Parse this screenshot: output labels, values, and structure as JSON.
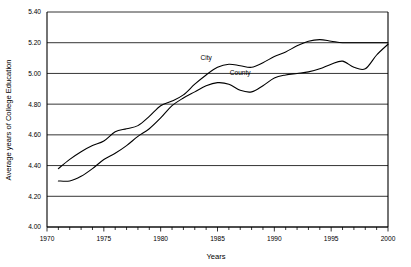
{
  "chart_data": {
    "type": "line",
    "title": "",
    "xlabel": "Years",
    "ylabel": "Average years of College Education",
    "xlim": [
      1970,
      2000
    ],
    "ylim": [
      4.0,
      5.4
    ],
    "ytick_step": 0.2,
    "yticks": [
      "4.00",
      "4.20",
      "4.40",
      "4.60",
      "4.80",
      "5.00",
      "5.20",
      "5.40"
    ],
    "ytick_values": [
      4.0,
      4.2,
      4.4,
      4.6,
      4.8,
      5.0,
      5.2,
      5.4
    ],
    "xticks": [
      "1970",
      "1975",
      "1980",
      "1985",
      "1990",
      "1995",
      "2000"
    ],
    "xtick_values": [
      1970,
      1975,
      1980,
      1985,
      1990,
      1995,
      2000
    ],
    "xtick_minor_step": 1,
    "grid": "horizontal",
    "legend": "inline-labels",
    "line_color": "#000000",
    "x": [
      1971,
      1972,
      1973,
      1974,
      1975,
      1976,
      1977,
      1978,
      1979,
      1980,
      1981,
      1982,
      1983,
      1984,
      1985,
      1986,
      1987,
      1988,
      1989,
      1990,
      1991,
      1992,
      1993,
      1994,
      1995,
      1996,
      1997,
      1998,
      1999,
      2000
    ],
    "series": [
      {
        "name": "City",
        "label_x": 1984,
        "label_y": 5.09,
        "values": [
          4.38,
          4.44,
          4.49,
          4.53,
          4.56,
          4.62,
          4.64,
          4.66,
          4.72,
          4.79,
          4.82,
          4.86,
          4.93,
          4.99,
          5.04,
          5.06,
          5.05,
          5.04,
          5.07,
          5.11,
          5.14,
          5.18,
          5.21,
          5.22,
          5.21,
          5.2,
          5.2,
          5.2,
          5.2,
          5.2
        ]
      },
      {
        "name": "County",
        "label_x": 1987,
        "label_y": 4.99,
        "values": [
          4.3,
          4.3,
          4.33,
          4.38,
          4.44,
          4.48,
          4.53,
          4.59,
          4.64,
          4.71,
          4.79,
          4.84,
          4.88,
          4.92,
          4.94,
          4.93,
          4.89,
          4.88,
          4.92,
          4.97,
          4.99,
          5.0,
          5.01,
          5.03,
          5.06,
          5.08,
          5.04,
          5.03,
          5.12,
          5.19
        ]
      }
    ]
  }
}
